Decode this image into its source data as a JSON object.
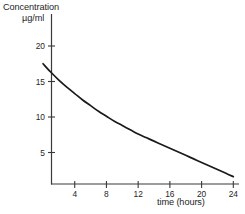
{
  "chart_data": {
    "type": "line",
    "title": "",
    "ylabel_line1": "Concentration",
    "ylabel_line2": "µg/ml",
    "xlabel": "time (hours)",
    "grid": false,
    "legend": "none",
    "xlim": [
      0,
      24
    ],
    "ylim": [
      0,
      22
    ],
    "xticks": [
      4,
      8,
      12,
      16,
      20,
      24
    ],
    "xtick_labels": [
      "4",
      "8",
      "12",
      "16",
      "20",
      "24"
    ],
    "yticks": [
      5,
      10,
      15,
      20
    ],
    "ytick_labels": [
      "5",
      "10",
      "15",
      "20"
    ],
    "series": [
      {
        "name": "concentration",
        "color": "#1a1a1a",
        "x": [
          0,
          1,
          2,
          3,
          4,
          5,
          6,
          7,
          8,
          9,
          10,
          11,
          12,
          13,
          14,
          15,
          16,
          17,
          18,
          19,
          20,
          21,
          22,
          23,
          24
        ],
        "values": [
          17.5,
          16.3,
          15.2,
          14.2,
          13.3,
          12.4,
          11.6,
          10.8,
          10.1,
          9.4,
          8.8,
          8.2,
          7.6,
          7.1,
          6.6,
          6.1,
          5.6,
          5.1,
          4.6,
          4.1,
          3.6,
          3.1,
          2.6,
          2.1,
          1.6
        ]
      }
    ]
  },
  "axes": {
    "yaxis_title_line1": "Concentration",
    "yaxis_title_line2": "µg/ml",
    "xaxis_title": "time (hours)"
  },
  "colors": {
    "background": "#ffffff",
    "axis": "#3a3a3a",
    "curve": "#1a1a1a",
    "text": "#262626"
  }
}
